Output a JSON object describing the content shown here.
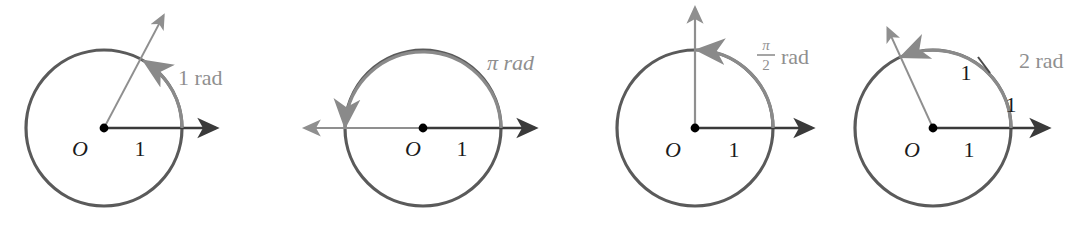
{
  "figure": {
    "background_color": "#ffffff",
    "colors": {
      "circle_stroke": "#5a5a5a",
      "arc_highlight": "#8a8a8a",
      "axis_dark": "#3a3a3a",
      "axis_gray": "#8f8f8f",
      "label_dark": "#1a1a1a",
      "label_gray": "#8f8f8f",
      "center_dot": "#000000"
    },
    "panels": [
      {
        "id": "panel-1-rad",
        "center_label": "O",
        "radius_label": "1",
        "angle_label": "1 rad",
        "angle_label_type": "plain",
        "angle_radians": 1.0,
        "center_x": 104,
        "center_y": 128,
        "radius": 78,
        "terminal_ray_extends": true,
        "initial_ray_direction": "right",
        "arc_direction": "counterclockwise",
        "extra_arc_labels": [],
        "tick_marks": 0
      },
      {
        "id": "panel-pi-rad",
        "center_label": "O",
        "radius_label": "1",
        "angle_label": "π rad",
        "angle_label_type": "plain",
        "angle_radians": 3.14159,
        "center_x": 423,
        "center_y": 128,
        "radius": 78,
        "terminal_ray_extends": true,
        "initial_ray_direction": "right",
        "arc_direction": "counterclockwise",
        "extra_arc_labels": [],
        "tick_marks": 0
      },
      {
        "id": "panel-pi-over-2-rad",
        "center_label": "O",
        "radius_label": "1",
        "angle_label_numerator": "π",
        "angle_label_denominator": "2",
        "angle_label_suffix": "rad",
        "angle_label_type": "fraction",
        "angle_radians": 1.5708,
        "center_x": 695,
        "center_y": 128,
        "radius": 78,
        "terminal_ray_extends": true,
        "initial_ray_direction": "right",
        "arc_direction": "counterclockwise",
        "extra_arc_labels": [],
        "tick_marks": 0
      },
      {
        "id": "panel-2-rad",
        "center_label": "O",
        "radius_label": "1",
        "angle_label": "2 rad",
        "angle_label_type": "plain",
        "angle_radians": 2.0,
        "center_x": 933,
        "center_y": 128,
        "radius": 78,
        "terminal_ray_extends": true,
        "initial_ray_direction": "right",
        "arc_direction": "counterclockwise",
        "extra_arc_labels": [
          "1",
          "1"
        ],
        "tick_marks": 1
      }
    ]
  }
}
